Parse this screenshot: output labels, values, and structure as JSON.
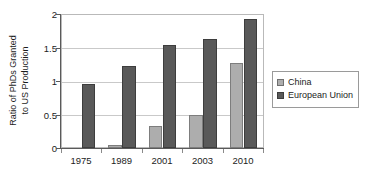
{
  "chart_data": {
    "type": "bar",
    "title": "",
    "xlabel": "",
    "ylabel": "Ratio of PhDs Granted to US Production",
    "ylabel_line1": "Ratio of PhDs Granted",
    "ylabel_line2": "to US Production",
    "categories": [
      "1975",
      "1989",
      "2001",
      "2003",
      "2010"
    ],
    "series": [
      {
        "name": "China",
        "color": "#adadad",
        "values": [
          0,
          0.05,
          0.33,
          0.5,
          1.27
        ]
      },
      {
        "name": "European Union",
        "color": "#595959",
        "values": [
          0.95,
          1.22,
          1.54,
          1.62,
          1.93
        ]
      }
    ],
    "ylim": [
      0,
      2
    ],
    "yticks": [
      "0",
      "0.5",
      "1",
      "1.5",
      "2"
    ],
    "ytick_values": [
      0,
      0.5,
      1,
      1.5,
      2
    ],
    "grid": true,
    "legend_position": "right"
  },
  "legend": {
    "items": [
      {
        "label": "China"
      },
      {
        "label": "European Union"
      }
    ]
  }
}
